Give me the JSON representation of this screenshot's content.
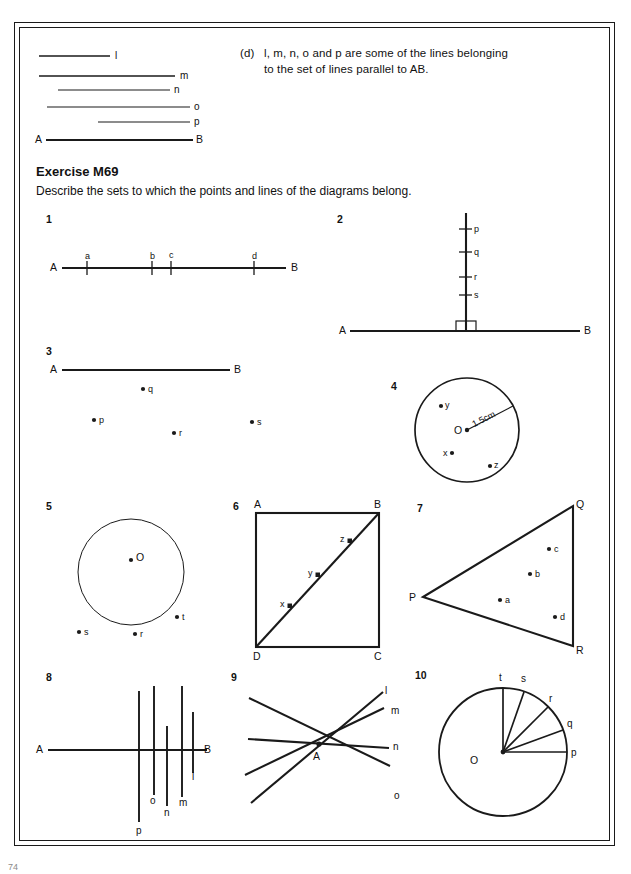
{
  "page": {
    "page_number": "74",
    "background": "#ffffff",
    "ink": "#111111"
  },
  "note_d": {
    "marker": "(d)",
    "line1": "l, m, n, o and p are some of the lines belonging",
    "line2": "to the set of lines parallel to AB."
  },
  "parallel_lines": {
    "start_label": "A",
    "end_label": "B",
    "labels": [
      "l",
      "m",
      "n",
      "o",
      "p"
    ]
  },
  "exercise": {
    "heading": "Exercise M69",
    "instruction": "Describe the sets to which the points and lines of the diagrams belong."
  },
  "questions": [
    {
      "number": "1",
      "type": "line-with-points",
      "end_labels": [
        "A",
        "B"
      ],
      "point_labels": [
        "a",
        "b",
        "c",
        "d"
      ]
    },
    {
      "number": "2",
      "type": "perpendicular-line",
      "end_labels": [
        "A",
        "B"
      ],
      "point_labels": [
        "p",
        "q",
        "r",
        "s"
      ],
      "right_angle_mark": true
    },
    {
      "number": "3",
      "type": "line-with-external-points",
      "end_labels": [
        "A",
        "B"
      ],
      "point_labels": [
        "q",
        "p",
        "r",
        "s"
      ]
    },
    {
      "number": "4",
      "type": "circle-with-radius",
      "centre_label": "O",
      "radius_label": "1.5cm",
      "point_labels": [
        "y",
        "x",
        "z"
      ]
    },
    {
      "number": "5",
      "type": "circle-with-external-points",
      "centre_label": "O",
      "point_labels": [
        "s",
        "r",
        "t"
      ]
    },
    {
      "number": "6",
      "type": "square-with-diagonal",
      "vertex_labels": [
        "A",
        "B",
        "C",
        "D"
      ],
      "point_labels": [
        "x",
        "y",
        "z"
      ]
    },
    {
      "number": "7",
      "type": "triangle-with-points",
      "vertex_labels": [
        "P",
        "Q",
        "R"
      ],
      "point_labels": [
        "a",
        "b",
        "c",
        "d"
      ]
    },
    {
      "number": "8",
      "type": "line-with-transversals",
      "end_labels": [
        "A",
        "B"
      ],
      "line_labels": [
        "p",
        "o",
        "n",
        "m",
        "l"
      ]
    },
    {
      "number": "9",
      "type": "concurrent-lines",
      "point_label": "A",
      "line_labels": [
        "l",
        "m",
        "n",
        "o"
      ]
    },
    {
      "number": "10",
      "type": "circle-with-radii",
      "centre_label": "O",
      "point_labels": [
        "t",
        "s",
        "r",
        "q",
        "p"
      ]
    }
  ]
}
